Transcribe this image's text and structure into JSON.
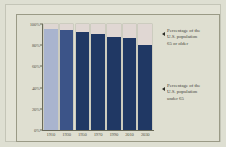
{
  "chart_data": {
    "type": "bar",
    "stacked": true,
    "title": "",
    "subtitle": "",
    "xlabel": "",
    "ylabel": "",
    "ylim": [
      0,
      100
    ],
    "ytick_labels": [
      "100%",
      "80%",
      "60%",
      "40%",
      "20%",
      "0%"
    ],
    "ytick_values": [
      100,
      80,
      60,
      40,
      20,
      0
    ],
    "grid": false,
    "legend_position": "right-annotations",
    "categories": [
      "1910",
      "1930",
      "1950",
      "1970",
      "1990",
      "2010",
      "2030"
    ],
    "series": [
      {
        "name": "Percentage of the U.S. population under 65",
        "color": "#203864",
        "values": [
          95,
          94,
          92,
          91,
          88,
          87,
          80
        ]
      },
      {
        "name": "Percentage of the U.S. population 65 or older",
        "color": "#e0d7d3",
        "values": [
          5,
          6,
          8,
          9,
          12,
          13,
          20
        ]
      }
    ],
    "annotations": [
      {
        "id": "old",
        "lines": [
          "Percentage of the",
          "U.S. population",
          "65 or older"
        ],
        "marker": "left-triangle"
      },
      {
        "id": "young",
        "lines": [
          "Percentage of the",
          "U.S. population",
          "under 65"
        ],
        "marker": "left-triangle"
      }
    ]
  },
  "axes": {
    "yticks": [
      {
        "label": "100%",
        "value": 100
      },
      {
        "label": "80%",
        "value": 80
      },
      {
        "label": "60%",
        "value": 60
      },
      {
        "label": "40%",
        "value": 40
      },
      {
        "label": "20%",
        "value": 20
      },
      {
        "label": "0%",
        "value": 0
      }
    ],
    "xticks": [
      {
        "label": "1910"
      },
      {
        "label": "1930"
      },
      {
        "label": "1950"
      },
      {
        "label": "1970"
      },
      {
        "label": "1990"
      },
      {
        "label": "2010"
      },
      {
        "label": "2030"
      }
    ]
  },
  "annotation_old": {
    "line1": "Percentage of the",
    "line2": "U.S. population",
    "line3": "65 or older"
  },
  "annotation_young": {
    "line1": "Percentage of the",
    "line2": "U.S. population",
    "line3": "under 65"
  },
  "colors": {
    "background": "#dedfd2",
    "paper": "#e3e3d6",
    "plate": "#dfdfd1",
    "bar_under65": "#203864",
    "bar_65plus": "#e0d7d3",
    "bar_first_under65": "#a9b4ce",
    "axis": "#6a6a58",
    "text": "#44443a"
  }
}
